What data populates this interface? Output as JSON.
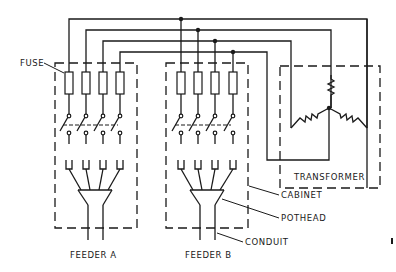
{
  "diagram": {
    "type": "electrical-schematic",
    "labels": {
      "fuse": "FUSE",
      "transformer": "TRANSFORMER",
      "cabinet": "CABINET",
      "pothead": "POTHEAD",
      "conduit": "CONDUIT",
      "feeder_a": "FEEDER A",
      "feeder_b": "FEEDER B"
    },
    "stroke_color": "#1a1a1a",
    "background": "#ffffff",
    "cabinets": [
      {
        "name": "feeder-a-cabinet",
        "phases": 4
      },
      {
        "name": "feeder-b-cabinet",
        "phases": 4
      }
    ],
    "transformer": {
      "winding": "wye",
      "windings": 3
    },
    "bus_lines": 4
  }
}
